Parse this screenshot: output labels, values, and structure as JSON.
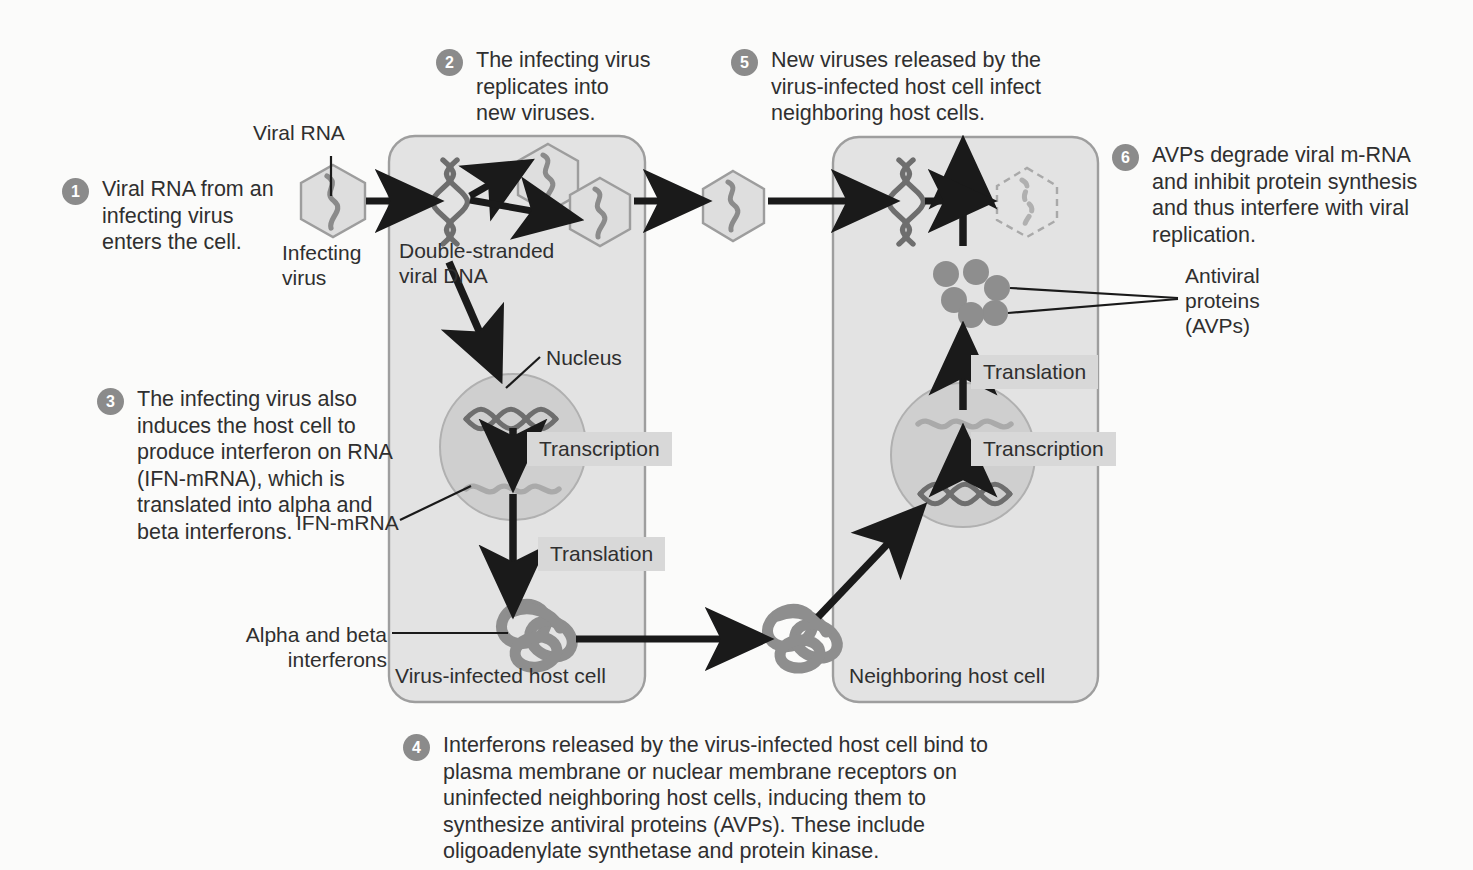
{
  "figure": {
    "background_color": "#fbfbfa",
    "badge_color": "#8b8b8b",
    "cell_fill": "#e2e2e2",
    "cell_stroke": "#9a9a9a",
    "nucleus_fill": "#cfcfcf",
    "shade_label_bg": "#d8d8d8",
    "avp_dot_color": "#8e8e8e",
    "virus_fill": "#dedede",
    "virus_stroke": "#9d9d9d",
    "dna_color": "#6e6e6e",
    "mrna_color": "#a9a9a9",
    "interferon_color": "#8e8e8e",
    "arrow_color": "#1a1a1a"
  },
  "steps": [
    {
      "number": "1",
      "text": "Viral RNA from an\ninfecting virus\nenters the cell."
    },
    {
      "number": "2",
      "text": "The infecting virus\nreplicates into\nnew viruses."
    },
    {
      "number": "3",
      "text": "The infecting virus also\ninduces the host cell to\nproduce interferon on RNA\n(IFN-mRNA), which is\ntranslated into alpha and\nbeta interferons."
    },
    {
      "number": "4",
      "text": "Interferons released by the virus-infected host cell bind to\nplasma membrane or nuclear membrane receptors on\nuninfected neighboring host cells, inducing them to\nsynthesize antiviral proteins (AVPs). These include\noligoadenylate synthetase and protein kinase."
    },
    {
      "number": "5",
      "text": "New viruses released by the\nvirus-infected host cell infect\nneighboring host cells."
    },
    {
      "number": "6",
      "text": "AVPs degrade viral m-RNA\nand inhibit protein synthesis\nand thus interfere with viral\nreplication."
    }
  ],
  "labels": {
    "viral_rna": "Viral RNA",
    "infecting_virus": "Infecting\nvirus",
    "double_stranded_viral_dna": "Double-stranded\nviral DNA",
    "nucleus": "Nucleus",
    "ifn_mrna": "IFN-mRNA",
    "alpha_beta_interferons": "Alpha and beta\ninterferons",
    "virus_infected_host_cell": "Virus-infected host cell",
    "neighboring_host_cell": "Neighboring host cell",
    "antiviral_proteins": "Antiviral\nproteins\n(AVPs)",
    "transcription_left": "Transcription",
    "translation_left": "Translation",
    "translation_right": "Translation",
    "transcription_right": "Transcription"
  }
}
